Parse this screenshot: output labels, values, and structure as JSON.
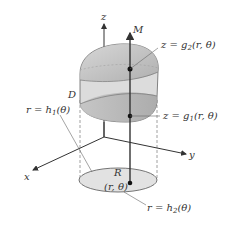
{
  "diagram": {
    "type": "3D solid region in cylindrical coordinates",
    "axes": {
      "z": "z",
      "x": "x",
      "y": "y"
    },
    "labels": {
      "M": "M",
      "D": "D",
      "R": "R",
      "point": "(r, θ)",
      "upper_surface": {
        "lhs": "z = g",
        "sub": "2",
        "rhs": "(r, θ)"
      },
      "lower_surface": {
        "lhs": "z = g",
        "sub": "1",
        "rhs": "(r, θ)"
      },
      "inner_curve": {
        "lhs": "r = h",
        "sub": "1",
        "rhs": "(θ)"
      },
      "outer_curve": {
        "lhs": "r = h",
        "sub": "2",
        "rhs": "(θ)"
      }
    },
    "colors": {
      "solid_fill": "#c8c8c8",
      "band_fill": "#dedede",
      "region_fill": "#e2e2e2",
      "line": "#333333",
      "leader": "#666666"
    }
  }
}
